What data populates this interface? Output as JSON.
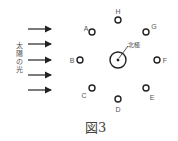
{
  "diagram": {
    "sunlight_label": "太陽の光",
    "north_pole_label": "北極",
    "figure_caption": "図3",
    "positions": [
      {
        "id": "H",
        "label": "H"
      },
      {
        "id": "A",
        "label": "A"
      },
      {
        "id": "G",
        "label": "G"
      },
      {
        "id": "B",
        "label": "B"
      },
      {
        "id": "F",
        "label": "F"
      },
      {
        "id": "C",
        "label": "C"
      },
      {
        "id": "E",
        "label": "E"
      },
      {
        "id": "D",
        "label": "D"
      }
    ],
    "arrow_count": 5
  }
}
